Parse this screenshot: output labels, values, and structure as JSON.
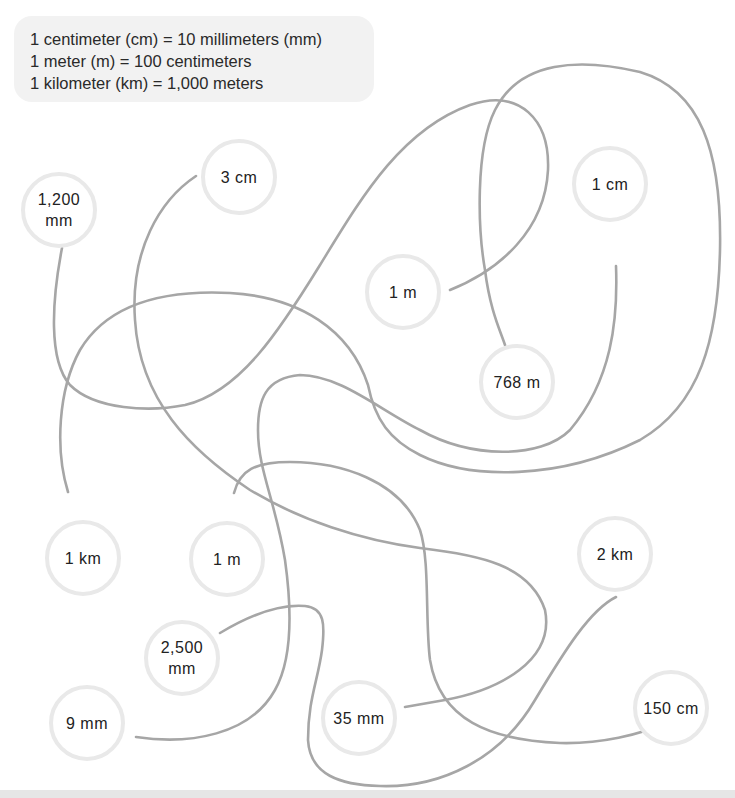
{
  "conversions": {
    "line1": "1 centimeter (cm) = 10 millimeters (mm)",
    "line2": "1 meter (m) = 100 centimeters",
    "line3": "1 kilometer (km) = 1,000 meters"
  },
  "nodes": {
    "n1200mm": "1,200\nmm",
    "n3cm": "3 cm",
    "n1cm": "1 cm",
    "n1m_upper": "1 m",
    "n768m": "768 m",
    "n1km": "1 km",
    "n1m_lower": "1 m",
    "n2km": "2 km",
    "n2500mm": "2,500\nmm",
    "n9mm": "9 mm",
    "n35mm": "35 mm",
    "n150cm": "150 cm"
  },
  "connections": [
    {
      "from": "1,200 mm",
      "to": "1 m"
    },
    {
      "from": "1 km",
      "to": "768 m"
    },
    {
      "from": "3 cm",
      "to": "35 mm"
    },
    {
      "from": "1 cm",
      "to": "9 mm"
    },
    {
      "from": "1 m",
      "to": "150 cm"
    },
    {
      "from": "2,500 mm",
      "to": "2 km"
    }
  ],
  "colors": {
    "line": "#a6a6a6",
    "node_border": "#e9e9e9",
    "panel_bg": "#f2f2f2"
  }
}
